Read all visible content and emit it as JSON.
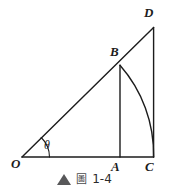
{
  "figure": {
    "caption": {
      "bullet_icon": "solid-triangle-icon",
      "label_glyph": "圖",
      "number": "1-4"
    },
    "canvas": {
      "width": 169,
      "height": 193,
      "background": "#ffffff",
      "stroke_color": "#1c1c1c",
      "stroke_width": 1.3
    },
    "points": {
      "O": {
        "label": "O",
        "x": 22,
        "y": 157,
        "label_x": 11,
        "label_y": 157
      },
      "A": {
        "label": "A",
        "x": 120,
        "y": 157,
        "label_x": 111,
        "label_y": 160
      },
      "C": {
        "label": "C",
        "x": 153,
        "y": 157,
        "label_x": 145,
        "label_y": 160
      },
      "B": {
        "label": "B",
        "x": 120,
        "y": 65,
        "label_x": 110,
        "label_y": 45
      },
      "D": {
        "label": "D",
        "x": 153,
        "y": 28,
        "label_x": 144,
        "label_y": 6
      }
    },
    "angle": {
      "symbol": "θ",
      "label_x": 44,
      "label_y": 139,
      "arc_radius": 24,
      "vertex": "O"
    },
    "segments": [
      {
        "name": "base-OC",
        "from": "O",
        "to": "C"
      },
      {
        "name": "hypotenuse-OD",
        "from": "O",
        "to": "D"
      },
      {
        "name": "vertical-BA",
        "from": "B",
        "to": "A"
      },
      {
        "name": "vertical-DC",
        "from": "D",
        "to": "C"
      }
    ],
    "arc_BC": {
      "name": "arc-B-to-C",
      "center": "O",
      "from": "B",
      "to": "C",
      "radius": 135
    }
  }
}
